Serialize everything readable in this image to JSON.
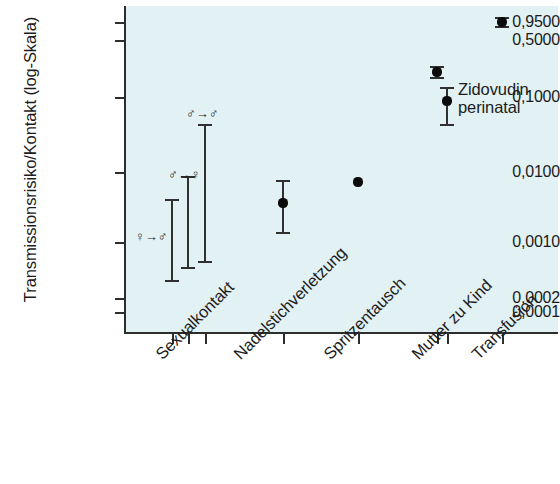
{
  "chart_data": {
    "type": "scatter",
    "title": "",
    "xlabel": "",
    "ylabel": "Transmissionsrisiko/Kontakt (log-Skala)",
    "y_scale": "log",
    "ylim": [
      0.0001,
      0.95
    ],
    "grid": false,
    "legend": null,
    "y_ticks": [
      {
        "value": 0.95,
        "label": "0,9500",
        "y": 22
      },
      {
        "value": 0.5,
        "label": "0,5000",
        "y": 40
      },
      {
        "value": 0.1,
        "label": "0,1000",
        "y": 97
      },
      {
        "value": 0.01,
        "label": "0,0100",
        "y": 172
      },
      {
        "value": 0.001,
        "label": "0,0010",
        "y": 242
      },
      {
        "value": 0.0002,
        "label": "0,0002",
        "y": 298
      },
      {
        "value": 0.0001,
        "label": "0,0001",
        "y": 312
      }
    ],
    "categories": [
      "Sexualkontakt",
      "Nadelstichverletzung",
      "Spritzentausch",
      "Mutter zu Kind",
      "Transfusion"
    ],
    "category_label_x": [
      152,
      230,
      320,
      408,
      468
    ],
    "points": [
      {
        "category": "Sexualkontakt",
        "symbol_label": "♀→♂",
        "x": 172,
        "estimate": null,
        "ci_low": 0.00033,
        "ci_high": 0.0027,
        "top_y": 200,
        "bottom_y": 281,
        "label_x": 135,
        "label_y": 230
      },
      {
        "category": "Sexualkontakt",
        "symbol_label": "♂→♀",
        "x": 188,
        "estimate": null,
        "ci_low": 0.00055,
        "ci_high": 0.0082,
        "top_y": 177,
        "bottom_y": 268,
        "label_x": 168,
        "label_y": 168
      },
      {
        "category": "Sexualkontakt",
        "symbol_label": "♂→♂",
        "x": 205,
        "estimate": null,
        "ci_low": 0.00062,
        "ci_high": 0.041,
        "top_y": 125,
        "bottom_y": 262,
        "label_x": 186,
        "label_y": 107
      },
      {
        "category": "Nadelstichverletzung",
        "symbol_label": "",
        "x": 283,
        "estimate": 0.0032,
        "ci_low": 0.0013,
        "ci_high": 0.013,
        "top_y": 181,
        "bottom_y": 233,
        "point_y": 203
      },
      {
        "category": "Spritzentausch",
        "symbol_label": "",
        "x": 358,
        "estimate": 0.0067,
        "ci_low": null,
        "ci_high": null,
        "point_y": 182
      },
      {
        "category": "Mutter zu Kind",
        "symbol_label": "",
        "x": 437,
        "estimate": 0.25,
        "ci_low": 0.22,
        "ci_high": 0.29,
        "top_y": 67,
        "bottom_y": 78,
        "point_y": 72
      },
      {
        "category": "Mutter zu Kind",
        "symbol_label": "",
        "x": 447,
        "estimate": 0.095,
        "ci_low": 0.038,
        "ci_high": 0.16,
        "top_y": 88,
        "bottom_y": 125,
        "point_y": 101
      },
      {
        "category": "Transfusion",
        "symbol_label": "",
        "x": 502,
        "estimate": 0.92,
        "ci_low": 0.88,
        "ci_high": 0.95,
        "top_y": 18,
        "bottom_y": 27,
        "point_y": 22
      }
    ],
    "annotations": [
      {
        "line1": "Zidovudin",
        "line2": "perinatal",
        "x": 458,
        "y": 80
      }
    ],
    "colors": {
      "plot_background": "#e2f1f4",
      "axis": "#2d2d2d",
      "marker": "#0b0b0b",
      "text": "#1c1c1c"
    }
  }
}
